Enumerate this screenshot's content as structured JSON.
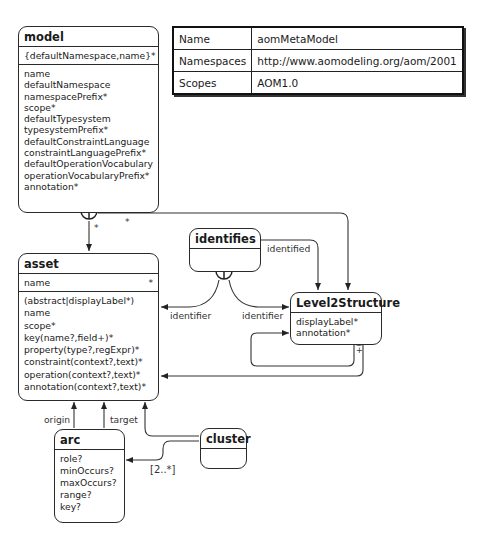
{
  "info_table": {
    "rows": [
      {
        "key": "Name",
        "value": "aomMetaModel"
      },
      {
        "key": "Namespaces",
        "value": "http://www.aomodeling.org/aom/2001"
      },
      {
        "key": "Scopes",
        "value": "AOM1.0"
      }
    ]
  },
  "entities": {
    "model": {
      "title": "model",
      "key": "{defaultNamespace,name}",
      "key_card": "*",
      "attributes": [
        "name",
        "defaultNamespace",
        "namespacePrefix*",
        "scope*",
        "defaultTypesystem",
        "typesystemPrefix*",
        "defaultConstraintLanguage",
        "constraintLanguagePrefix*",
        "defaultOperationVocabulary",
        "operationVocabularyPrefix*",
        "annotation*"
      ]
    },
    "asset": {
      "title": "asset",
      "key": "name",
      "key_card": "*",
      "attributes": [
        "(abstract|displayLabel*)",
        "name",
        "scope*",
        "key(name?,field+)*",
        "property(type?,regExpr)*",
        "constraint(context?,text)*",
        "operation(context?,text)*",
        "annotation(context?,text)*"
      ]
    },
    "identifies": {
      "title": "identifies"
    },
    "level2structure": {
      "title": "Level2Structure",
      "attributes": [
        "displayLabel*",
        "annotation*"
      ]
    },
    "arc": {
      "title": "arc",
      "attributes": [
        "role?",
        "minOccurs?",
        "maxOccurs?",
        "range?",
        "key?"
      ]
    },
    "cluster": {
      "title": "cluster"
    }
  },
  "labels": {
    "model_asset_card": "*",
    "model_l2_card": "*",
    "identified": "identified",
    "identifier_left": "identifier",
    "identifier_right": "identifier",
    "origin": "origin",
    "target": "target",
    "cluster_arc_card": "[2..*]",
    "l2_loop_card": "+"
  }
}
